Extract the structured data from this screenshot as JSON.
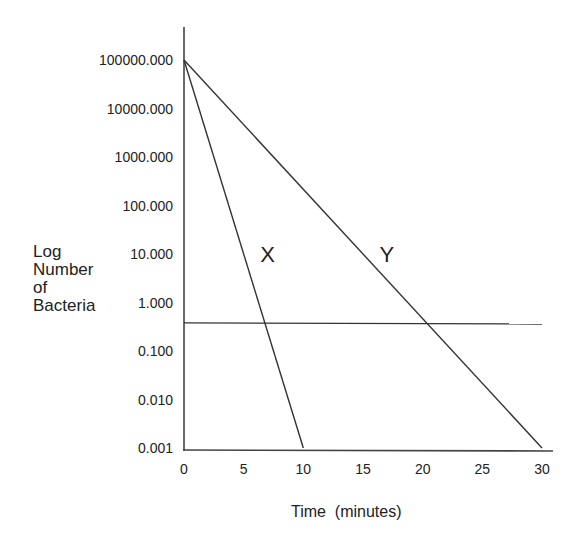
{
  "chart_data": {
    "type": "line",
    "title": "",
    "xlabel": "Time  (minutes)",
    "ylabel_lines": [
      "Log",
      "Number",
      "of",
      "Bacteria"
    ],
    "x_ticks": [
      0,
      5,
      10,
      15,
      20,
      25,
      30
    ],
    "x_tick_labels": [
      "0",
      "5",
      "10",
      "15",
      "20",
      "25",
      "30"
    ],
    "y_scale": "log",
    "y_ticks": [
      100000,
      10000,
      1000,
      100,
      10,
      1,
      0.1,
      0.01,
      0.001
    ],
    "y_tick_labels": [
      "100000.000",
      "10000.000",
      "1000.000",
      "100.000",
      "10.000",
      "1.000",
      "0.100",
      "0.010",
      "0.001"
    ],
    "xlim": [
      0,
      30
    ],
    "ylim": [
      0.001,
      100000
    ],
    "grid": false,
    "legend": "none",
    "series": [
      {
        "name": "X",
        "label": "X",
        "x": [
          0,
          10
        ],
        "y": [
          100000,
          0.001
        ],
        "label_at": {
          "x": 7,
          "y": 10
        }
      },
      {
        "name": "Y",
        "label": "Y",
        "x": [
          0,
          30
        ],
        "y": [
          100000,
          0.001
        ],
        "label_at": {
          "x": 17,
          "y": 10
        }
      }
    ],
    "reference_line": {
      "name": "threshold",
      "x": [
        0,
        30
      ],
      "y": [
        0.38,
        0.36
      ]
    }
  }
}
